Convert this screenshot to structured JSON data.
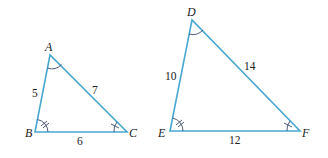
{
  "diagram": {
    "colors": {
      "edge": "#4aa8d0",
      "arc": "#3a4a6a",
      "text": "#222222"
    },
    "triangle_abc": {
      "vertices": {
        "A": "A",
        "B": "B",
        "C": "C"
      },
      "sides": {
        "AB": "5",
        "AC": "7",
        "BC": "6"
      }
    },
    "triangle_def": {
      "vertices": {
        "D": "D",
        "E": "E",
        "F": "F"
      },
      "sides": {
        "DE": "10",
        "DF": "14",
        "EF": "12"
      }
    },
    "angle_marks": {
      "A_D": "single arc",
      "B_E": "arc with double tick",
      "C_F": "arc with single tick"
    }
  }
}
